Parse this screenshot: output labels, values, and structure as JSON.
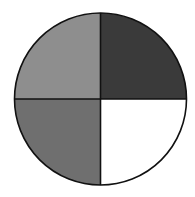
{
  "chart_data": {
    "type": "pie",
    "title": "",
    "categories": [
      "Top-right quarter",
      "Bottom-right quarter",
      "Bottom-left quarter",
      "Top-left quarter"
    ],
    "values": [
      25,
      25,
      25,
      25
    ],
    "colors": [
      "#3a3a3a",
      "#ffffff",
      "#6f6f6f",
      "#8e8e8e"
    ],
    "legend": "none",
    "grid": false
  },
  "diagram": {
    "shape": "circle divided into four equal quarters",
    "center": [
      100.5,
      99
    ],
    "radius": 86,
    "stroke": "#111111",
    "quadrants": [
      {
        "name": "top-right",
        "fill": "#3a3a3a"
      },
      {
        "name": "bottom-right",
        "fill": "#ffffff"
      },
      {
        "name": "bottom-left",
        "fill": "#6f6f6f"
      },
      {
        "name": "top-left",
        "fill": "#8e8e8e"
      }
    ]
  }
}
